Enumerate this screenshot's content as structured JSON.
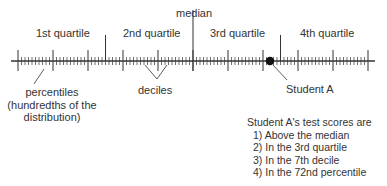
{
  "labels": {
    "median": "median",
    "quartiles": [
      "1st quartile",
      "2nd quartile",
      "3rd quartile",
      "4th quartile"
    ],
    "percentiles": [
      "percentiles",
      "(hundredths of the",
      "distribution)"
    ],
    "deciles": "deciles",
    "student": "Student A"
  },
  "scale": {
    "min_percentile": 0,
    "max_percentile": 100,
    "decile_step": 10,
    "quartile_step": 25,
    "student_percentile": 72
  },
  "notes": {
    "heading": "Student A's test scores are",
    "items": [
      "1) Above the median",
      "2) In the 3rd quartile",
      "3) In the 7th decile",
      "4) In the 72nd percentile"
    ]
  },
  "colors": {
    "line": "#333333",
    "dot": "#111111",
    "text": "#333333"
  }
}
